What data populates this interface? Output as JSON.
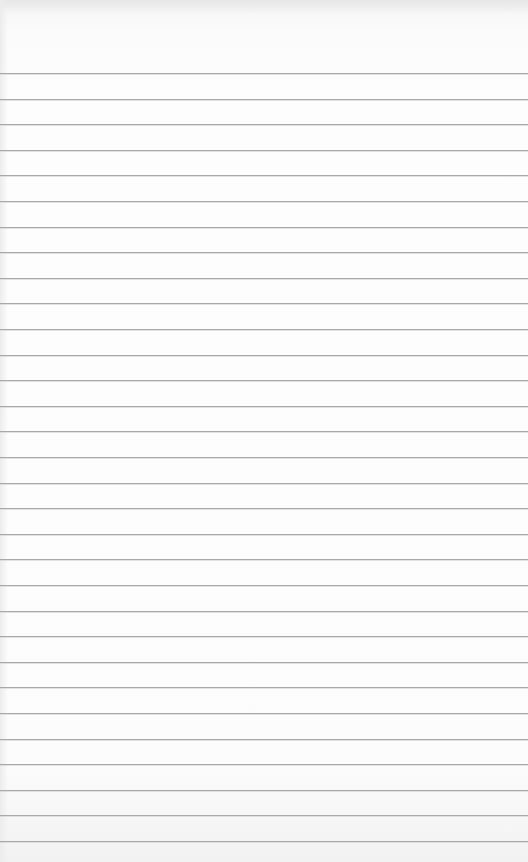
{
  "paper": {
    "type": "lined-notepad",
    "line_color": "#a9a9a9",
    "background_color": "#fcfcfc",
    "first_line_y": 73,
    "line_spacing": 25.6,
    "line_count": 31
  }
}
